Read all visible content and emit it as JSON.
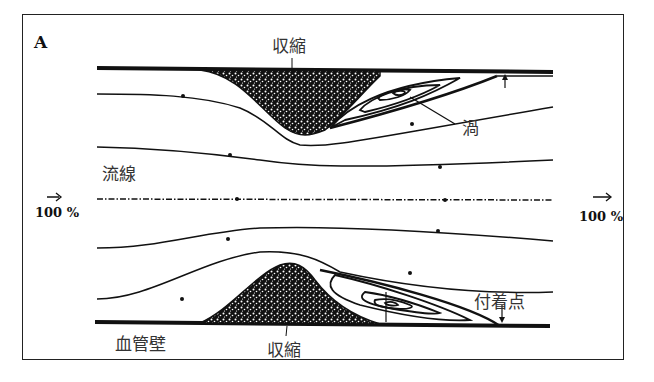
{
  "figure": {
    "panel_label": "A",
    "labels": {
      "stenosis_top": "収縮",
      "stenosis_bottom": "収縮",
      "vortex": "渦",
      "streamline": "流線",
      "vessel_wall": "血管壁",
      "reattachment_point": "付着点"
    },
    "flow_inlet": {
      "arrow": "→",
      "value": "100 %"
    },
    "flow_outlet": {
      "arrow": "→",
      "value": "100 %"
    },
    "colors": {
      "line": "#111111",
      "plaque": "#1a1a1a",
      "text": "#333333",
      "background": "#ffffff"
    }
  }
}
